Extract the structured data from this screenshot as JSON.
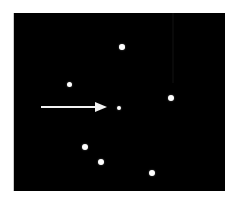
{
  "figure": {
    "canvas": {
      "width": 236,
      "height": 202,
      "background_color": "#ffffff"
    },
    "panel": {
      "name": "stimulus-panel",
      "x": 14,
      "y": 13,
      "width": 211,
      "height": 178,
      "background_color": "#000000"
    },
    "dot_color": "#ffffff",
    "arrow_color": "#f2f2f2",
    "dots": [
      {
        "id": "dot-top",
        "cx": 122,
        "cy": 47,
        "d": 5.5
      },
      {
        "id": "dot-upper-left",
        "cx": 69,
        "cy": 84,
        "d": 5.0
      },
      {
        "id": "dot-center",
        "cx": 119,
        "cy": 108,
        "d": 4.5
      },
      {
        "id": "dot-right",
        "cx": 171,
        "cy": 98,
        "d": 6.0
      },
      {
        "id": "dot-lower-left",
        "cx": 85,
        "cy": 147,
        "d": 6.0
      },
      {
        "id": "dot-lower-mid",
        "cx": 101,
        "cy": 162,
        "d": 6.0
      },
      {
        "id": "dot-bottom-right",
        "cx": 152,
        "cy": 173,
        "d": 6.0
      }
    ],
    "arrow": {
      "id": "direction-arrow",
      "direction": "right",
      "shaft_x": 41,
      "shaft_y": 106,
      "shaft_length": 55,
      "shaft_thickness": 2,
      "head_x": 95,
      "head_y": 102,
      "head_length": 12,
      "head_height": 10
    },
    "artifact_band": {
      "x": 172,
      "width": 2,
      "height": 70
    }
  },
  "chart_data": {
    "type": "scatter",
    "xlabel": "",
    "ylabel": "",
    "xlim": [
      0,
      211
    ],
    "ylim": [
      0,
      178
    ],
    "grid": false,
    "legend": "none",
    "series": [
      {
        "name": "dots",
        "marker": "circle",
        "color": "#ffffff",
        "points": [
          {
            "x": 108,
            "y": 34
          },
          {
            "x": 55,
            "y": 71
          },
          {
            "x": 105,
            "y": 95
          },
          {
            "x": 157,
            "y": 85
          },
          {
            "x": 71,
            "y": 134
          },
          {
            "x": 87,
            "y": 149
          },
          {
            "x": 138,
            "y": 160
          }
        ]
      }
    ],
    "annotations": [
      {
        "type": "arrow",
        "label": "",
        "from": {
          "x": 27,
          "y": 94
        },
        "to": {
          "x": 93,
          "y": 94
        },
        "color": "#f2f2f2"
      }
    ]
  }
}
